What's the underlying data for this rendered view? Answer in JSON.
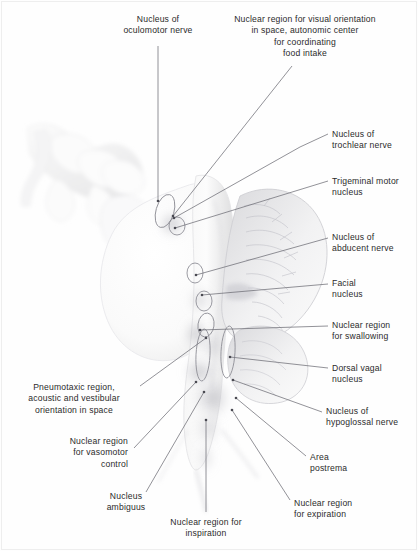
{
  "figure": {
    "width": 418,
    "height": 551,
    "background": "#fefefe",
    "border_color": "#eeeeee",
    "text_color": "#2b2b2b",
    "leader_color": "#6e6e76",
    "marker_color": "#8a8a92"
  },
  "labels": [
    {
      "id": "oculomotor",
      "text": "Nucleus of\noculomotor nerve",
      "align": "center",
      "x": 98,
      "y": 14,
      "width": 120
    },
    {
      "id": "visual-orientation",
      "text": "Nuclear region for visual orientation\nin space, autonomic center\nfor coordinating\nfood intake",
      "align": "center",
      "x": 216,
      "y": 14,
      "width": 178
    },
    {
      "id": "trochlear",
      "text": "Nucleus of\ntrochlear nerve",
      "align": "left",
      "x": 332,
      "y": 129,
      "width": 86
    },
    {
      "id": "trigeminal-motor",
      "text": "Trigeminal motor\nnucleus",
      "align": "left",
      "x": 332,
      "y": 176,
      "width": 86
    },
    {
      "id": "abducent",
      "text": "Nucleus of\nabducent nerve",
      "align": "left",
      "x": 332,
      "y": 232,
      "width": 86
    },
    {
      "id": "facial",
      "text": "Facial\nnucleus",
      "align": "left",
      "x": 332,
      "y": 278,
      "width": 86
    },
    {
      "id": "swallowing",
      "text": "Nuclear region\nfor swallowing",
      "align": "left",
      "x": 332,
      "y": 320,
      "width": 86
    },
    {
      "id": "dorsal-vagal",
      "text": "Dorsal vagal\nnucleus",
      "align": "left",
      "x": 332,
      "y": 363,
      "width": 86
    },
    {
      "id": "hypoglossal",
      "text": "Nucleus of\nhypoglossal nerve",
      "align": "left",
      "x": 326,
      "y": 406,
      "width": 92
    },
    {
      "id": "area-postrema",
      "text": "Area\npostrema",
      "align": "left",
      "x": 310,
      "y": 452,
      "width": 86
    },
    {
      "id": "pneumotaxic",
      "text": "Pneumotaxic region,\nacoustic and vestibular\norientation in space",
      "align": "center",
      "x": 12,
      "y": 382,
      "width": 124
    },
    {
      "id": "vasomotor",
      "text": "Nuclear region\nfor vasomotor\ncontrol",
      "align": "right",
      "x": 52,
      "y": 436,
      "width": 76
    },
    {
      "id": "ambiguus",
      "text": "Nucleus\nambiguus",
      "align": "center",
      "x": 94,
      "y": 491,
      "width": 64
    },
    {
      "id": "inspiration",
      "text": "Nuclear region for\ninspiration",
      "align": "center",
      "x": 150,
      "y": 517,
      "width": 112
    },
    {
      "id": "expiration",
      "text": "Nuclear region\nfor expiration",
      "align": "left",
      "x": 294,
      "y": 498,
      "width": 86
    }
  ],
  "leader_lines": [
    {
      "id": "leader-oculomotor",
      "points": "158,46 158,201"
    },
    {
      "id": "leader-visual",
      "points": "292,66 173,216"
    },
    {
      "id": "leader-trochlear",
      "points": "328,134 300,147 174,218"
    },
    {
      "id": "leader-trigeminal",
      "points": "328,181 175,228"
    },
    {
      "id": "leader-abducent",
      "points": "328,238 196,275"
    },
    {
      "id": "leader-facial",
      "points": "328,284 202,295"
    },
    {
      "id": "leader-swallowing",
      "points": "328,326 200,330"
    },
    {
      "id": "leader-dorsal-vagal",
      "points": "328,368 230,357"
    },
    {
      "id": "leader-hypoglossal",
      "points": "322,412 233,380"
    },
    {
      "id": "leader-area-postrema",
      "points": "306,456 236,398"
    },
    {
      "id": "leader-pneumotaxic",
      "points": "140,386 206,338"
    },
    {
      "id": "leader-vasomotor",
      "points": "134,448 196,382"
    },
    {
      "id": "leader-ambiguus",
      "points": "146,492 204,392"
    },
    {
      "id": "leader-inspiration",
      "points": "206,512 206,420"
    },
    {
      "id": "leader-expiration",
      "points": "290,500 232,410"
    }
  ],
  "nucleus_markers": [
    {
      "id": "marker-oculomotor",
      "cx": 165,
      "cy": 211,
      "rx": 9,
      "ry": 17,
      "rot": 16
    },
    {
      "id": "marker-trochlear",
      "cx": 177,
      "cy": 226,
      "rx": 8,
      "ry": 9,
      "rot": 0
    },
    {
      "id": "marker-abducent",
      "cx": 195,
      "cy": 273,
      "rx": 8,
      "ry": 10,
      "rot": 0
    },
    {
      "id": "marker-facial",
      "cx": 204,
      "cy": 301,
      "rx": 8,
      "ry": 10,
      "rot": 0
    },
    {
      "id": "marker-swallowing",
      "cx": 206,
      "cy": 325,
      "rx": 8,
      "ry": 12,
      "rot": 8
    },
    {
      "id": "marker-medial-col",
      "cx": 203,
      "cy": 355,
      "rx": 7,
      "ry": 26,
      "rot": 3
    },
    {
      "id": "marker-lateral-col",
      "cx": 228,
      "cy": 352,
      "rx": 7,
      "ry": 26,
      "rot": 3
    }
  ]
}
